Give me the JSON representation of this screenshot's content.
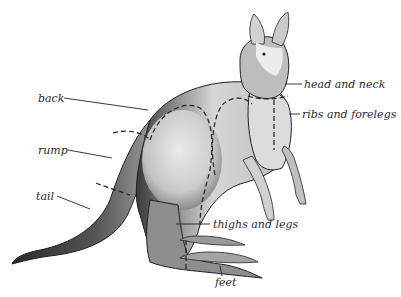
{
  "diagram": {
    "style": "grayscale ink illustration with dashed region boundaries",
    "colors": {
      "background": "#ffffff",
      "ink": "#2a2a2a",
      "fur_light": "#d8d8d8",
      "fur_mid": "#a0a0a0",
      "fur_dark": "#3a3a3a"
    },
    "labels": [
      {
        "id": "back",
        "text": "back",
        "side": "left"
      },
      {
        "id": "rump",
        "text": "rump",
        "side": "left"
      },
      {
        "id": "tail",
        "text": "tail",
        "side": "left"
      },
      {
        "id": "head_and_neck",
        "text": "head and neck",
        "side": "right"
      },
      {
        "id": "ribs_and_forelegs",
        "text": "ribs and forelegs",
        "side": "right"
      },
      {
        "id": "thighs_and_legs",
        "text": "thighs and legs",
        "side": "right"
      },
      {
        "id": "feet",
        "text": "feet",
        "side": "bottom"
      }
    ]
  }
}
